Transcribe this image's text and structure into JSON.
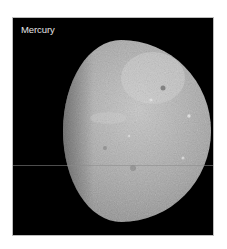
{
  "image": {
    "label": "Mercury",
    "subject": "planet-mercury-gibbous",
    "colors": {
      "background": "#000000",
      "frame_border": "#bdbdbd",
      "label_text": "#e6e6e6",
      "planet_light": "#c8c8c8",
      "planet_mid": "#9a9a9a",
      "planet_dark": "#3a3a3a"
    }
  }
}
